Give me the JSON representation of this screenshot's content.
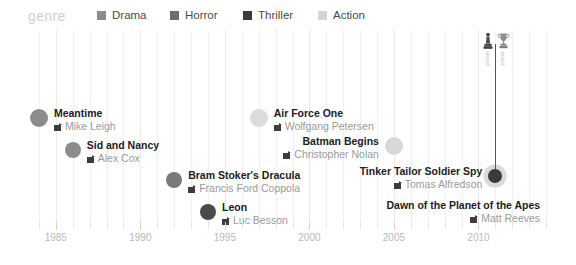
{
  "legend": {
    "title": "genre",
    "items": [
      {
        "label": "Drama",
        "color": "#8c8c8c"
      },
      {
        "label": "Horror",
        "color": "#6e6e6e"
      },
      {
        "label": "Thriller",
        "color": "#3a3a3a"
      },
      {
        "label": "Action",
        "color": "#d5d5d5"
      }
    ]
  },
  "axis": {
    "ticks": [
      1985,
      1990,
      1995,
      2000,
      2005,
      2010
    ],
    "range": [
      1983,
      2015
    ]
  },
  "awards": {
    "icon_statuette": "oscar-statuette-icon",
    "icon_trophy": "trophy-cup-icon",
    "label_left": "award",
    "label_right": "award"
  },
  "chart_data": {
    "type": "scatter",
    "title": "genre",
    "xlabel": "",
    "ylabel": "",
    "xlim": [
      1983,
      2015
    ],
    "grid": true,
    "legend_position": "top",
    "points": [
      {
        "title": "Meantime",
        "director": "Mike Leigh",
        "year": 1984,
        "genre": "Drama",
        "color": "#8c8c8c",
        "radius": 9,
        "align": "left",
        "highlighted": false
      },
      {
        "title": "Sid and Nancy",
        "director": "Alex Cox",
        "year": 1986,
        "genre": "Drama",
        "color": "#8c8c8c",
        "radius": 8,
        "align": "left",
        "highlighted": false
      },
      {
        "title": "Bram Stoker's Dracula",
        "director": "Francis Ford Coppola",
        "year": 1992,
        "genre": "Horror",
        "color": "#7a7a7a",
        "radius": 8,
        "align": "left",
        "highlighted": false
      },
      {
        "title": "Leon",
        "director": "Luc Besson",
        "year": 1994,
        "genre": "Thriller",
        "color": "#4a4a4a",
        "radius": 8,
        "align": "left",
        "highlighted": false
      },
      {
        "title": "Air Force One",
        "director": "Wolfgang Petersen",
        "year": 1997,
        "genre": "Action",
        "color": "#dcdcdc",
        "radius": 9,
        "align": "left",
        "highlighted": false
      },
      {
        "title": "Batman Begins",
        "director": "Christopher Nolan",
        "year": 2005,
        "genre": "Action",
        "color": "#d8d8d8",
        "radius": 9,
        "align": "right",
        "highlighted": false
      },
      {
        "title": "Tinker Tailor Soldier Spy",
        "director": "Tomas Alfredson",
        "year": 2011,
        "genre": "Thriller",
        "color": "#3a3a3a",
        "radius": 7,
        "align": "right",
        "highlighted": true
      },
      {
        "title": "Dawn of the Planet of the Apes",
        "director": "Matt Reeves",
        "year": 2014,
        "genre": "Action",
        "color": "#ffffff",
        "radius": 0,
        "align": "right",
        "highlighted": false
      }
    ]
  }
}
